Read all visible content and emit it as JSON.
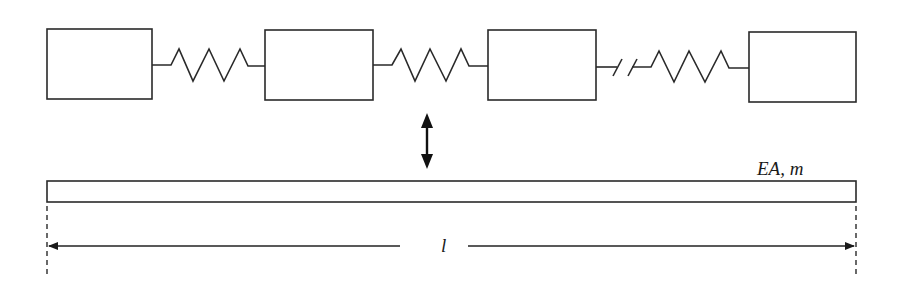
{
  "diagram": {
    "masses": [
      {
        "id": "mass-1",
        "x": 47,
        "y": 29,
        "w": 105,
        "h": 70
      },
      {
        "id": "mass-2",
        "x": 265,
        "y": 30,
        "w": 108,
        "h": 70
      },
      {
        "id": "mass-3",
        "x": 488,
        "y": 30,
        "w": 108,
        "h": 70
      },
      {
        "id": "mass-4",
        "x": 749,
        "y": 32,
        "w": 107,
        "h": 70
      }
    ],
    "springs": [
      {
        "id": "spring-1",
        "from": "mass-1",
        "to": "mass-2",
        "broken": false
      },
      {
        "id": "spring-2",
        "from": "mass-2",
        "to": "mass-3",
        "broken": false
      },
      {
        "id": "spring-3",
        "from": "mass-3",
        "to": "mass-4",
        "broken": true
      }
    ],
    "equivalence_arrow": "double-headed vertical arrow",
    "bar": {
      "label": "EA, m"
    },
    "dimension": {
      "label": "l"
    },
    "colors": {
      "stroke": "#2a2a2a",
      "background": "#ffffff"
    }
  }
}
